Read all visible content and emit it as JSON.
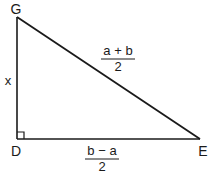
{
  "diagram": {
    "type": "right-triangle",
    "colors": {
      "stroke": "#1a1a1a",
      "background": "#ffffff"
    },
    "vertices": [
      {
        "id": "G",
        "label": "G",
        "x": 17,
        "y": 17,
        "label_x": 16,
        "label_y": 14
      },
      {
        "id": "D",
        "label": "D",
        "x": 17,
        "y": 139,
        "label_x": 16,
        "label_y": 156
      },
      {
        "id": "E",
        "label": "E",
        "x": 200,
        "y": 139,
        "label_x": 203,
        "label_y": 156
      }
    ],
    "right_angle_at": "D",
    "sides": {
      "GD": {
        "label": "x"
      },
      "GE": {
        "numerator": "a + b",
        "denominator": "2"
      },
      "DE": {
        "numerator": "b − a",
        "denominator": "2"
      }
    }
  }
}
